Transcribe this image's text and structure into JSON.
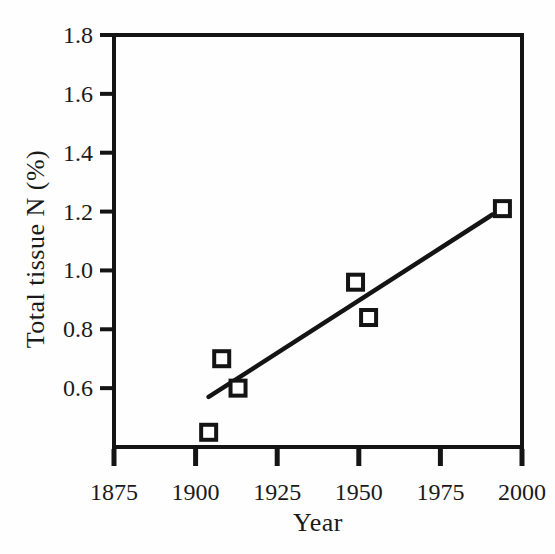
{
  "figure": {
    "xlabel": "Year",
    "ylabel": "Total tissue N (%)"
  },
  "chart_data": {
    "type": "scatter",
    "title": "",
    "xlabel": "Year",
    "ylabel": "Total tissue N (%)",
    "xlim": [
      1875,
      2000
    ],
    "ylim": [
      0.4,
      1.8
    ],
    "xticks": [
      "1875",
      "1900",
      "1925",
      "1950",
      "1975",
      "2000"
    ],
    "yticks": [
      "0.6",
      "0.8",
      "1.0",
      "1.2",
      "1.4",
      "1.6",
      "1.8"
    ],
    "grid": false,
    "legend": "none",
    "marker": "open-square",
    "colors": {
      "foreground": "#141414",
      "marker_fill": "#ffffff",
      "background": "#fefefe"
    },
    "points": [
      {
        "x": 1904,
        "y": 0.45
      },
      {
        "x": 1908,
        "y": 0.7
      },
      {
        "x": 1913,
        "y": 0.6
      },
      {
        "x": 1949,
        "y": 0.96
      },
      {
        "x": 1953,
        "y": 0.84
      },
      {
        "x": 1994,
        "y": 1.21
      }
    ],
    "trendline": {
      "x1": 1904,
      "y1": 0.57,
      "x2": 1991,
      "y2": 1.19
    }
  }
}
